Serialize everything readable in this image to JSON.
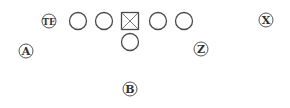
{
  "diagram": {
    "colors": {
      "stroke": "#4a4a4a",
      "text": "#333333",
      "background": "#ffffff"
    },
    "linemen": [
      {
        "id": "lt",
        "shape": "circle",
        "cx": 78,
        "cy": 21,
        "r": 8.5
      },
      {
        "id": "lg",
        "shape": "circle",
        "cx": 104,
        "cy": 21,
        "r": 8.5
      },
      {
        "id": "c",
        "shape": "square-x",
        "cx": 130,
        "cy": 21,
        "size": 17
      },
      {
        "id": "rg",
        "shape": "circle",
        "cx": 158,
        "cy": 21,
        "r": 8.5
      },
      {
        "id": "rt",
        "shape": "circle",
        "cx": 184,
        "cy": 21,
        "r": 8.5
      }
    ],
    "quarterback": {
      "id": "qb",
      "shape": "circle",
      "cx": 130,
      "cy": 42,
      "r": 8.5
    },
    "labeled_players": [
      {
        "id": "te",
        "label": "TE",
        "cx": 49,
        "cy": 21,
        "r": 7,
        "font_size": 10
      },
      {
        "id": "a",
        "label": "A",
        "cx": 26,
        "cy": 51,
        "r": 7,
        "font_size": 11
      },
      {
        "id": "z",
        "label": "Z",
        "cx": 201,
        "cy": 49,
        "r": 7,
        "font_size": 11
      },
      {
        "id": "x",
        "label": "X",
        "cx": 266,
        "cy": 20,
        "r": 7,
        "font_size": 11
      },
      {
        "id": "b",
        "label": "B",
        "cx": 130,
        "cy": 89,
        "r": 7,
        "font_size": 11
      }
    ]
  }
}
